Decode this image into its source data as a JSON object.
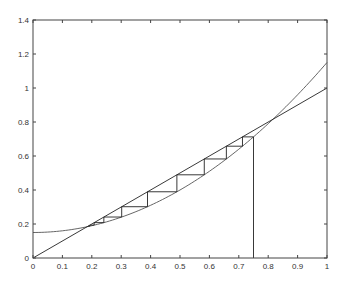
{
  "chart_data": {
    "type": "line",
    "title": "",
    "xlabel": "",
    "ylabel": "",
    "xlim": [
      0,
      1
    ],
    "ylim": [
      0,
      1.4
    ],
    "grid": false,
    "legend": null,
    "x_ticks": [
      "0",
      "0.1",
      "0.2",
      "0.3",
      "0.4",
      "0.5",
      "0.6",
      "0.7",
      "0.8",
      "0.9",
      "1"
    ],
    "y_ticks": [
      "0",
      "0.2",
      "0.4",
      "0.6",
      "0.8",
      "1",
      "1.2",
      "1.4"
    ],
    "series": [
      {
        "name": "f(x) = x^2 + 0.15",
        "kind": "curve",
        "x": [
          0,
          0.1,
          0.2,
          0.3,
          0.4,
          0.5,
          0.6,
          0.7,
          0.8,
          0.9,
          1.0
        ],
        "values": [
          0.15,
          0.16,
          0.19,
          0.24,
          0.31,
          0.4,
          0.51,
          0.64,
          0.79,
          0.96,
          1.15
        ],
        "color": "#555555"
      },
      {
        "name": "y = x",
        "kind": "line",
        "x": [
          0,
          1
        ],
        "values": [
          0,
          1
        ],
        "color": "#222222"
      },
      {
        "name": "cobweb iteration",
        "kind": "cobweb",
        "x0": 0.75,
        "iterates": [
          0.75,
          0.7125,
          0.6577,
          0.5826,
          0.4894,
          0.3895,
          0.3017,
          0.241,
          0.2081,
          0.1933,
          0.1874
        ],
        "color": "#222222"
      }
    ],
    "annotations": []
  }
}
